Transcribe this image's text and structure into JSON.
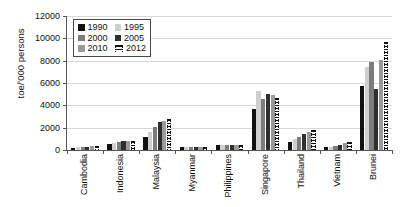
{
  "chart_data": {
    "type": "bar",
    "title": "",
    "subtitle": "",
    "xlabel": "",
    "ylabel": "toe/'000 persons",
    "ylim": [
      0,
      12000
    ],
    "ytick_values": [
      0,
      2000,
      4000,
      6000,
      8000,
      10000,
      12000
    ],
    "ytick_labels": [
      "0",
      "2000",
      "4000",
      "6000",
      "8000",
      "10000",
      "12000"
    ],
    "grid": true,
    "legend_position": "top-left",
    "categories": [
      "Cambodia",
      "Indonesia",
      "Malaysia",
      "Myanmar",
      "Philippines",
      "Singapore",
      "Thailand",
      "Vietnam",
      "Brunei"
    ],
    "series": [
      {
        "name": "1990",
        "color": "#111111",
        "values": [
          180,
          520,
          1200,
          230,
          420,
          3700,
          720,
          230,
          5700
        ]
      },
      {
        "name": "1995",
        "color": "#cfcfcf",
        "values": [
          230,
          600,
          1650,
          240,
          450,
          5300,
          1000,
          270,
          7400
        ]
      },
      {
        "name": "2000",
        "color": "#7c7c7c",
        "values": [
          260,
          680,
          2100,
          250,
          450,
          4600,
          1150,
          330,
          7900
        ]
      },
      {
        "name": "2005",
        "color": "#2f2f2f",
        "values": [
          300,
          780,
          2500,
          250,
          440,
          5000,
          1450,
          460,
          5500
        ]
      },
      {
        "name": "2010",
        "color": "#9a9a9a",
        "values": [
          340,
          830,
          2600,
          260,
          430,
          4950,
          1600,
          620,
          8050
        ]
      },
      {
        "name": "2012",
        "color": "#ffffff",
        "values": [
          360,
          850,
          2800,
          260,
          430,
          4650,
          1800,
          680,
          9650
        ]
      }
    ]
  },
  "legend": {
    "entries": [
      {
        "label": "1990"
      },
      {
        "label": "1995"
      },
      {
        "label": "2000"
      },
      {
        "label": "2005"
      },
      {
        "label": "2010"
      },
      {
        "label": "2012"
      }
    ]
  }
}
